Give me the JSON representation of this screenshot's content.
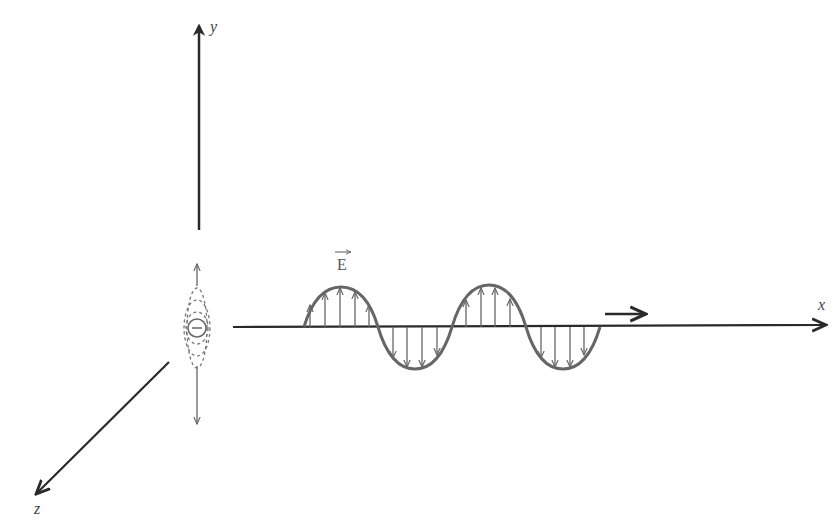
{
  "diagram": {
    "axes": {
      "x_label": "x",
      "y_label": "y",
      "z_label": "z"
    },
    "field_label": "E",
    "field_vector_symbol": "→",
    "charge_symbol": "−",
    "propagation_direction": "+x",
    "colors": {
      "axis": "#2a2a2a",
      "wave": "#666666",
      "background": "#ffffff"
    }
  }
}
